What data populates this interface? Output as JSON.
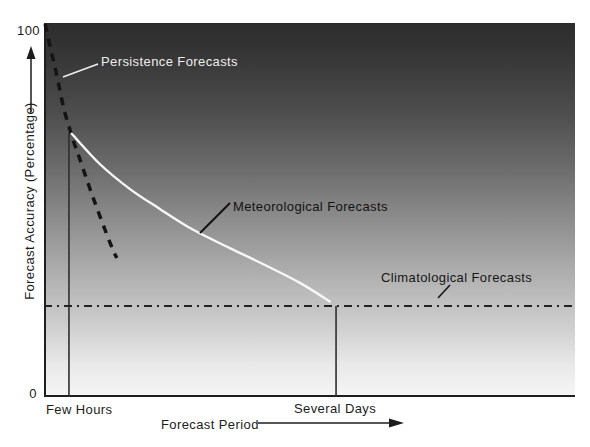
{
  "axes": {
    "y_label": "Forecast Accuracy (Percentage)",
    "y_tick_top": "100",
    "y_tick_bottom": "0",
    "x_label": "Forecast Period",
    "x_tick_left": "Few Hours",
    "x_tick_right": "Several Days"
  },
  "colors": {
    "plot_gradient_top": "#2c2c2c",
    "plot_gradient_bottom": "#f5f5f5",
    "axis_line": "#1f1f1f",
    "white_curve": "#f7f7f7",
    "dark_line": "#161616"
  },
  "chart_data": {
    "type": "line",
    "title": "",
    "xlabel": "Forecast Period",
    "ylabel": "Forecast Accuracy (Percentage)",
    "x_axis_type": "qualitative",
    "x_ticks": [
      "Few Hours",
      "Several Days"
    ],
    "x_tick_positions": [
      0.047,
      0.55
    ],
    "ylim": [
      0,
      100
    ],
    "y_ticks": [
      0,
      100
    ],
    "grid": "off",
    "legend": "inline-annotations",
    "background": "vertical gray gradient, dark at top (high accuracy) to light at bottom",
    "series": [
      {
        "name": "Persistence Forecasts",
        "style": {
          "stroke": "#141414",
          "width": 3.5,
          "dash": "8 7"
        },
        "points": [
          [
            0.002,
            99.7
          ],
          [
            0.013,
            92.8
          ],
          [
            0.024,
            86.1
          ],
          [
            0.038,
            76.7
          ],
          [
            0.055,
            68.7
          ],
          [
            0.068,
            63.4
          ],
          [
            0.094,
            52.7
          ],
          [
            0.124,
            41.4
          ],
          [
            0.137,
            37.2
          ]
        ]
      },
      {
        "name": "Meteorological Forecasts",
        "style": {
          "stroke": "#f7f7f7",
          "width": 2.4,
          "dash": ""
        },
        "points": [
          [
            0.051,
            70.6
          ],
          [
            0.105,
            62.3
          ],
          [
            0.162,
            55.6
          ],
          [
            0.218,
            50.3
          ],
          [
            0.281,
            44.7
          ],
          [
            0.35,
            39.8
          ],
          [
            0.416,
            35.3
          ],
          [
            0.482,
            30.5
          ],
          [
            0.54,
            25.4
          ]
        ]
      },
      {
        "name": "Climatological Forecasts",
        "style": {
          "stroke": "#242424",
          "width": 2,
          "dash": "8 5 2 5"
        },
        "points": [
          [
            0.0,
            24.3
          ],
          [
            1.0,
            24.3
          ]
        ]
      }
    ],
    "reference_lines": [
      {
        "name": "few-hours-dropline",
        "x": 0.047,
        "y_top": 70.6,
        "y_bottom": 0,
        "stroke": "#2e2e2e",
        "width": 1.6
      },
      {
        "name": "several-days-dropline",
        "x": 0.55,
        "y_top": 24.3,
        "y_bottom": 0,
        "stroke": "#2e2e2e",
        "width": 1.6
      }
    ],
    "annotations": [
      {
        "text": "Persistence Forecasts",
        "color": "#ededed",
        "text_px": [
          101,
          54
        ],
        "leader_px": [
          [
            63,
            77
          ],
          [
            98,
            64
          ]
        ],
        "leader_color": "#ededed",
        "leader_width": 1.7
      },
      {
        "text": "Meteorological Forecasts",
        "color": "#121212",
        "text_px": [
          233,
          199
        ],
        "leader_px": [
          [
            200,
            233
          ],
          [
            230,
            203
          ]
        ],
        "leader_color": "#121212",
        "leader_width": 2
      },
      {
        "text": "Climatological Forecasts",
        "color": "#161616",
        "text_px": [
          381,
          270
        ],
        "leader_px": [
          [
            438,
            298
          ],
          [
            450,
            285
          ]
        ],
        "leader_color": "#161616",
        "leader_width": 1.6
      }
    ]
  }
}
